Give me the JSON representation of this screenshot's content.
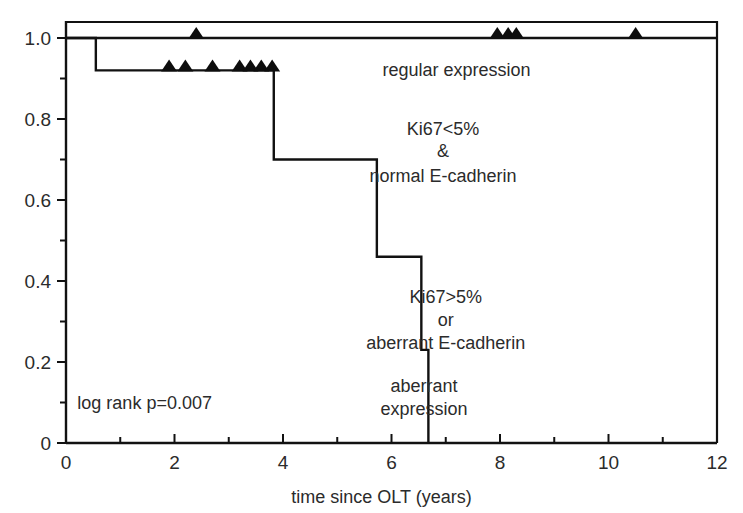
{
  "chart_data": {
    "type": "line",
    "subtype": "kaplan-meier-step",
    "title": "",
    "xlabel": "time since OLT (years)",
    "ylabel": "",
    "xlim": [
      0,
      12
    ],
    "ylim": [
      0,
      1.05
    ],
    "grid": false,
    "legend_position": "inline-annotations",
    "x_ticks_major": [
      0,
      2,
      4,
      6,
      8,
      10,
      12
    ],
    "x_tick_labels": [
      "0",
      "2",
      "4",
      "6",
      "8",
      "10",
      "12"
    ],
    "x_ticks_minor": [
      1,
      3,
      5,
      7,
      9,
      11
    ],
    "y_ticks_major": [
      0,
      0.2,
      0.4,
      0.6,
      0.8,
      1.0
    ],
    "y_tick_labels": [
      "0",
      "0.2",
      "0.4",
      "0.6",
      "0.8",
      "1.0"
    ],
    "y_ticks_minor": [
      0.1,
      0.3,
      0.5,
      0.7,
      0.9
    ],
    "series": [
      {
        "name": "regular expression",
        "group_label": "Ki67<5% & normal E-cadherin",
        "steps_x": [
          0,
          12
        ],
        "steps_y": [
          1.0,
          1.0
        ],
        "censor_times": [
          2.4,
          7.95,
          8.15,
          8.3,
          10.5
        ],
        "censor_survival": 1.0
      },
      {
        "name": "aberrant expression",
        "group_label": "Ki67>5% or aberrant E-cadherin",
        "steps_x": [
          0,
          0.55,
          0.55,
          3.83,
          3.83,
          5.73,
          5.73,
          6.55,
          6.55,
          6.68,
          6.68
        ],
        "steps_y": [
          1.0,
          1.0,
          0.92,
          0.92,
          0.7,
          0.7,
          0.46,
          0.46,
          0.23,
          0.23,
          0.0
        ],
        "censor_times": [
          1.9,
          2.2,
          2.7,
          3.2,
          3.4,
          3.6,
          3.8
        ],
        "censor_survival": 0.92
      }
    ],
    "annotations": [
      {
        "id": "upper-group-name",
        "text": "regular expression",
        "x": 7.2,
        "y": 0.905
      },
      {
        "id": "upper-criteria-line1",
        "text": "Ki67<5%",
        "x": 6.95,
        "y": 0.76
      },
      {
        "id": "upper-criteria-line2",
        "text": "&",
        "x": 6.95,
        "y": 0.705
      },
      {
        "id": "upper-criteria-line3",
        "text": "normal E-cadherin",
        "x": 6.95,
        "y": 0.645
      },
      {
        "id": "lower-criteria-line1",
        "text": "Ki67>5%",
        "x": 7.0,
        "y": 0.345
      },
      {
        "id": "lower-criteria-line2",
        "text": "or",
        "x": 7.0,
        "y": 0.29
      },
      {
        "id": "lower-criteria-line3",
        "text": "aberrant E-cadherin",
        "x": 7.0,
        "y": 0.232
      },
      {
        "id": "lower-group-name-line1",
        "text": "aberrant",
        "x": 6.6,
        "y": 0.125
      },
      {
        "id": "lower-group-name-line2",
        "text": "expression",
        "x": 6.6,
        "y": 0.068
      },
      {
        "id": "statistic",
        "text": "log rank p=0.007",
        "x": 1.45,
        "y": 0.085
      }
    ],
    "statistic": {
      "test": "log rank",
      "label": "log rank p=0.007",
      "p_value": 0.007
    },
    "colors": {
      "curve": "#111111",
      "axis": "#111111",
      "text": "#2b2b2b",
      "censor_marker": "#0d0d0d",
      "background": "#ffffff"
    }
  }
}
